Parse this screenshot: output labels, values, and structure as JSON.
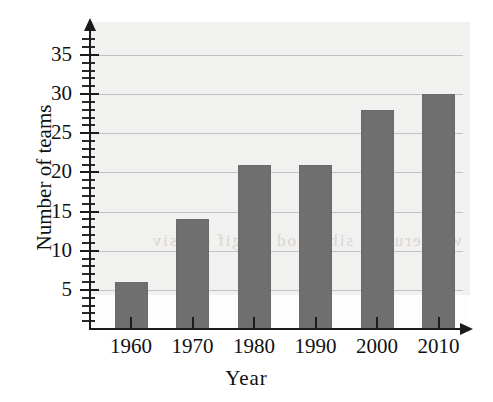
{
  "chart_data": {
    "type": "bar",
    "title": "",
    "xlabel": "Year",
    "ylabel": "Number of teams",
    "categories": [
      "1960",
      "1970",
      "1980",
      "1990",
      "2000",
      "2010"
    ],
    "values": [
      6,
      14,
      21,
      21,
      28,
      30
    ],
    "ylim": [
      0,
      37
    ],
    "xlim": [
      0,
      7
    ],
    "y_major_ticks": [
      5,
      10,
      15,
      20,
      25,
      30,
      35
    ],
    "y_tick_labels": [
      "5",
      "10",
      "15",
      "20",
      "25",
      "30",
      "35"
    ],
    "y_minor_tick_step": 1,
    "grid": "horizontal",
    "legend": "none",
    "series": [
      {
        "name": "Number of teams",
        "values": [
          6,
          14,
          21,
          21,
          28,
          30
        ],
        "color": "#6f6f6f"
      }
    ],
    "annotations": []
  },
  "axes": {
    "y_title": "Number of teams",
    "x_title": "Year",
    "y_arrow": "arrow-up-icon",
    "x_arrow": "arrow-right-icon"
  },
  "colors": {
    "bar_fill": "#6f6f6f",
    "axis": "#1b1b1b",
    "gridline": "#c2c2c2",
    "plot_background": "#f1f1f0",
    "page_background": "#ffffff"
  },
  "artifacts": {
    "bleed_through_text": "woh  erutcip  siht  seod  erugif  elbisiv"
  }
}
